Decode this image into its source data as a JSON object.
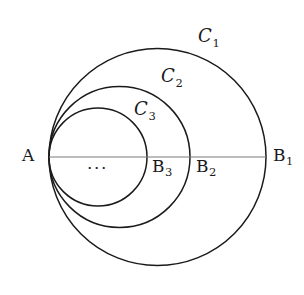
{
  "figure": {
    "background_color": "#ffffff",
    "stroke_color": "#1a1a1a",
    "diameter_line_color": "#7a7a7a",
    "width": 304,
    "height": 295
  },
  "chart_data": {
    "type": "diagram",
    "tangent_point": {
      "label": "A",
      "x": 49,
      "y": 157
    },
    "diameter_line": {
      "x1": 49,
      "y1": 157,
      "x2": 266,
      "y2": 157
    },
    "circles": [
      {
        "name": "C1",
        "label": "C₁",
        "cx": 157.5,
        "cy": 157,
        "r": 108.5,
        "right_endpoint_label": "B1",
        "right_endpoint_x": 266
      },
      {
        "name": "C2",
        "label": "C₂",
        "cx": 119.5,
        "cy": 157,
        "r": 70.5,
        "right_endpoint_label": "B2",
        "right_endpoint_x": 190
      },
      {
        "name": "C3",
        "label": "C₃",
        "cx": 98.0,
        "cy": 157,
        "r": 49.0,
        "right_endpoint_label": "B3",
        "right_endpoint_x": 147
      }
    ]
  },
  "labels": {
    "tangent_point": {
      "text": "A",
      "x": 22,
      "y": 147
    },
    "circle_labels": [
      {
        "base": "C",
        "sub": "1",
        "x": 198,
        "y": 27
      },
      {
        "base": "C",
        "sub": "2",
        "x": 161,
        "y": 67
      },
      {
        "base": "C",
        "sub": "3",
        "x": 134,
        "y": 100
      }
    ],
    "point_labels": [
      {
        "base": "B",
        "sub": "1",
        "x": 273,
        "y": 147
      },
      {
        "base": "B",
        "sub": "2",
        "x": 196,
        "y": 158
      },
      {
        "base": "B",
        "sub": "3",
        "x": 152,
        "y": 158
      }
    ],
    "ellipsis": {
      "text": "···",
      "x": 87,
      "y": 160
    }
  }
}
